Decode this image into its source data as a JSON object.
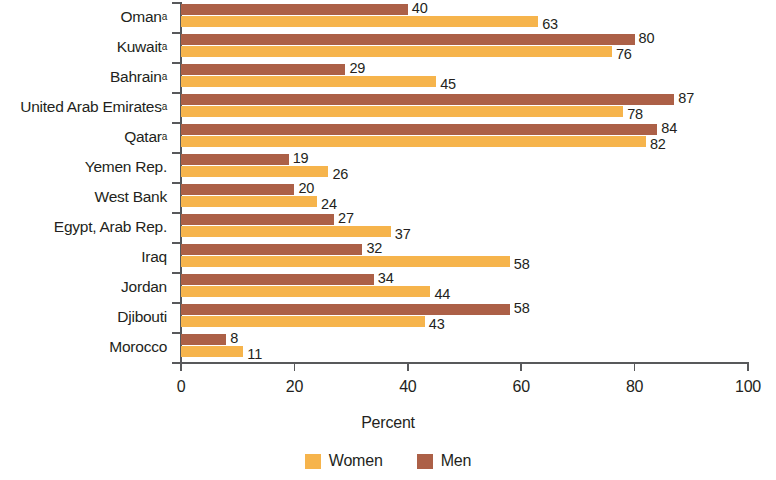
{
  "chart_data": {
    "type": "bar",
    "orientation": "horizontal",
    "title": "",
    "xlabel": "Percent",
    "ylabel": "",
    "xlim": [
      0,
      100
    ],
    "xticks": [
      0,
      20,
      40,
      60,
      80,
      100
    ],
    "grid": false,
    "legend_position": "bottom-center",
    "categories": [
      "Oman",
      "Kuwait",
      "Bahrain",
      "United Arab Emirates",
      "Qatar",
      "Yemen Rep.",
      "West  Bank",
      "Egypt, Arab Rep.",
      "Iraq",
      "Jordan",
      "Djibouti",
      "Morocco"
    ],
    "category_footnotes": [
      "a",
      "a",
      "a",
      "a",
      "a",
      "",
      "",
      "",
      "",
      "",
      "",
      ""
    ],
    "series": [
      {
        "name": "Men",
        "color": "#ac6047",
        "values": [
          40,
          80,
          29,
          87,
          84,
          19,
          20,
          27,
          32,
          34,
          58,
          8
        ]
      },
      {
        "name": "Women",
        "color": "#f6b44c",
        "values": [
          63,
          76,
          45,
          78,
          82,
          26,
          24,
          37,
          58,
          44,
          43,
          11
        ]
      }
    ]
  },
  "legend": {
    "items": [
      {
        "label": "Women",
        "color": "#f6b44c"
      },
      {
        "label": "Men",
        "color": "#ac6047"
      }
    ]
  },
  "axis": {
    "x_title": "Percent"
  }
}
